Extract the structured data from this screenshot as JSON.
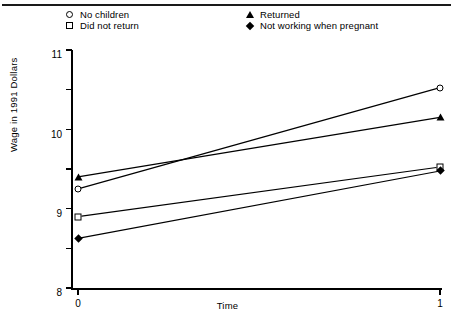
{
  "chart_data": {
    "type": "line",
    "title": "",
    "xlabel": "Time",
    "ylabel": "Wage in 1991 Dollars",
    "x": [
      0,
      1
    ],
    "xtick_labels": [
      "0",
      "1"
    ],
    "xlim": [
      0,
      1
    ],
    "ylim": [
      5,
      11
    ],
    "ytick_labels": [
      "5",
      "6",
      "7",
      "8",
      "9",
      "10",
      "11"
    ],
    "yticks": [
      5,
      6,
      7,
      8,
      9,
      10,
      11
    ],
    "grid": false,
    "legend_position": "top",
    "series": [
      {
        "name": "No children",
        "marker": "circle",
        "values": [
          7.5,
          10.05
        ]
      },
      {
        "name": "Did not return",
        "marker": "square",
        "values": [
          6.8,
          8.05
        ]
      },
      {
        "name": "Returned",
        "marker": "triangle",
        "values": [
          7.8,
          9.3
        ]
      },
      {
        "name": "Not working when pregnant",
        "marker": "diamond",
        "values": [
          6.25,
          7.95
        ]
      }
    ]
  },
  "legend": {
    "items": [
      {
        "label": "No children",
        "marker": "circle-marker"
      },
      {
        "label": "Did not return",
        "marker": "square-marker"
      },
      {
        "label": "Returned",
        "marker": "triangle-marker"
      },
      {
        "label": "Not working when pregnant",
        "marker": "diamond-marker"
      }
    ]
  },
  "axes": {
    "y_title": "Wage in 1991 Dollars",
    "x_title": "Time",
    "y_ticks": [
      "11",
      "10",
      "9",
      "8",
      "7",
      "6",
      "5"
    ],
    "x_ticks": [
      "0",
      "1"
    ]
  },
  "colors": {
    "ink": "#000000",
    "background": "#ffffff"
  }
}
